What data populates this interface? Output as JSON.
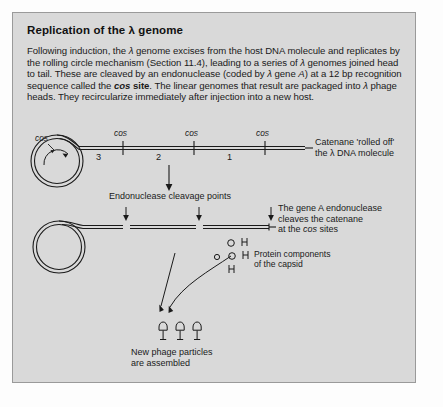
{
  "panel": {
    "title": "Replication of the λ genome",
    "body": {
      "seg1": "Following induction, the ",
      "lambda1": "λ",
      "seg2": " genome excises from the host DNA molecule and replicates by the rolling circle mechanism (Section 11.4), leading to a series of ",
      "lambda2": "λ",
      "seg3": " genomes joined head to tail. These are cleaved by an endonuclease (coded by ",
      "lambda3": "λ",
      "seg4": " gene ",
      "geneA": "A",
      "seg5": ") at a 12 bp recognition sequence called the ",
      "cosbold": "cos",
      "sitebold": " site",
      "seg6": ". The linear genomes that result are packaged into ",
      "lambda4": "λ",
      "seg7": " phage heads. They recircularize immediately after injection into a new host."
    }
  },
  "diagram": {
    "catenane": {
      "circle_cos_label": "cos",
      "cos_sites": [
        "cos",
        "cos",
        "cos"
      ],
      "segment_numbers": [
        "3",
        "2",
        "1"
      ],
      "caption_line1": "Catenane 'rolled off'",
      "caption_line2": "the λ DNA molecule"
    },
    "cleavage": {
      "label": "Endonuclease cleavage points",
      "caption_line1": "The gene A endonuclease",
      "caption_line2": "cleaves the catenane",
      "caption_line3_pre": "at the ",
      "caption_line3_cos": "cos",
      "caption_line3_post": " sites"
    },
    "proteins": {
      "glyphs": [
        "O",
        "H",
        "O",
        "O",
        "H",
        "H"
      ],
      "caption_line1": "Protein components",
      "caption_line2": "of the capsid"
    },
    "phage": {
      "particle_count": 3,
      "caption_line1": "New phage particles",
      "caption_line2": "are assembled"
    }
  },
  "colors": {
    "panel_bg": "#d9d9d9",
    "panel_border": "#9a9a9a",
    "ink": "#1a1a1a",
    "page_bg": "#fdfdfd"
  }
}
